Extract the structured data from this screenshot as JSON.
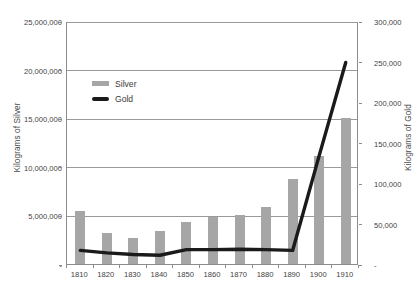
{
  "chart_data": {
    "type": "bar",
    "title": "",
    "subtitle": "",
    "categories": [
      "1810",
      "1820",
      "1830",
      "1840",
      "1850",
      "1860",
      "1870",
      "1880",
      "1890",
      "1900",
      "1910"
    ],
    "xlabel": "",
    "series": [
      {
        "name": "Silver",
        "type": "bar",
        "axis": "left",
        "color": "#a6a6a6",
        "unit": "Kilograms of Silver",
        "values": [
          5500000,
          3200000,
          2700000,
          3400000,
          4300000,
          4800000,
          5000000,
          5900000,
          8700000,
          11100000,
          15000000
        ]
      },
      {
        "name": "Gold",
        "type": "line",
        "axis": "right",
        "color": "#1a1a1a",
        "unit": "Kilograms of Gold",
        "values": [
          18000,
          15000,
          13000,
          12000,
          19000,
          19000,
          19500,
          19000,
          18000,
          135000,
          250000
        ]
      }
    ],
    "left_axis": {
      "label": "Kilograms of Silver",
      "ylim": [
        0,
        25000000
      ],
      "ticks": [
        0,
        5000000,
        10000000,
        15000000,
        20000000,
        25000000
      ],
      "tick_labels": [
        "-",
        "5,000,000",
        "10,000,000",
        "15,000,000",
        "20,000,000",
        "25,000,000"
      ]
    },
    "right_axis": {
      "label": "Kilograms of Gold",
      "ylim": [
        0,
        300000
      ],
      "ticks": [
        0,
        50000,
        100000,
        150000,
        200000,
        250000,
        300000
      ],
      "tick_labels": [
        "-",
        "50,000",
        "100,000",
        "150,000",
        "200,000",
        "250,000",
        "300,000"
      ]
    },
    "grid": {
      "horizontal": true,
      "vertical": false,
      "color": "#9a9a9a"
    },
    "legend": {
      "position": "inside-top-left",
      "entries": [
        {
          "label": "Silver",
          "marker": "bar-swatch",
          "color": "#a6a6a6"
        },
        {
          "label": "Gold",
          "marker": "line-swatch",
          "color": "#1a1a1a"
        }
      ]
    }
  }
}
